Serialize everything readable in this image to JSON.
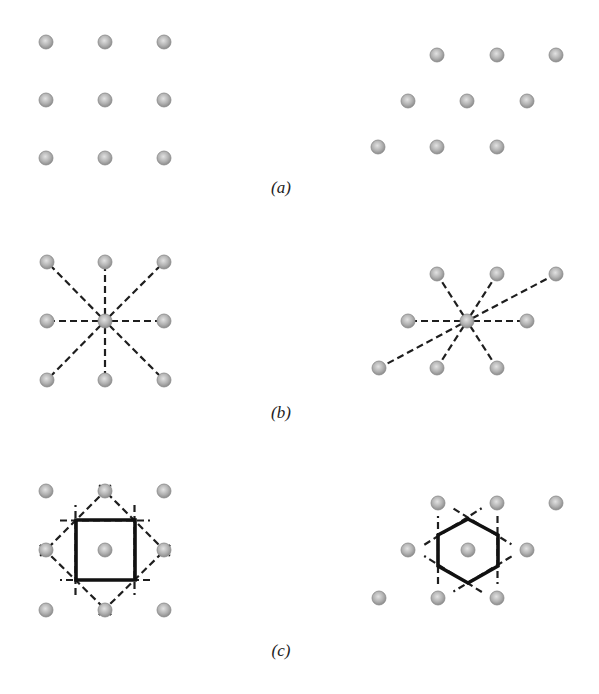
{
  "figure": {
    "panels": [
      {
        "id": "a",
        "label": "(a)",
        "label_pos": [
          281,
          193
        ],
        "description": "Square lattice (left) and hexagonal/oblique lattice (right) of atoms",
        "left_lattice": {
          "type": "square",
          "atoms": [
            [
              46,
              42
            ],
            [
              105,
              42
            ],
            [
              164,
              42
            ],
            [
              46,
              100
            ],
            [
              105,
              100
            ],
            [
              164,
              100
            ],
            [
              46,
              158
            ],
            [
              105,
              158
            ],
            [
              164,
              158
            ]
          ]
        },
        "right_lattice": {
          "type": "hexagonal",
          "atoms": [
            [
              437,
              55
            ],
            [
              497,
              55
            ],
            [
              556,
              55
            ],
            [
              408,
              101
            ],
            [
              467,
              101
            ],
            [
              527,
              101
            ],
            [
              378,
              147
            ],
            [
              437,
              147
            ],
            [
              497,
              147
            ]
          ]
        }
      },
      {
        "id": "b",
        "label": "(b)",
        "label_pos": [
          281,
          418
        ],
        "description": "Dashed lines from central atom to all neighbours",
        "left_lattice": {
          "type": "square",
          "center": [
            105,
            321
          ],
          "atoms": [
            [
              47,
              262
            ],
            [
              105,
              262
            ],
            [
              164,
              262
            ],
            [
              47,
              321
            ],
            [
              105,
              321
            ],
            [
              164,
              321
            ],
            [
              47,
              380
            ],
            [
              105,
              380
            ],
            [
              164,
              380
            ]
          ]
        },
        "right_lattice": {
          "type": "hexagonal",
          "center": [
            467,
            321
          ],
          "atoms": [
            [
              437,
              274
            ],
            [
              497,
              274
            ],
            [
              556,
              274
            ],
            [
              408,
              321
            ],
            [
              467,
              321
            ],
            [
              527,
              321
            ],
            [
              379,
              368
            ],
            [
              437,
              368
            ],
            [
              497,
              368
            ]
          ]
        }
      },
      {
        "id": "c",
        "label": "(c)",
        "label_pos": [
          281,
          656
        ],
        "description": "Wigner-Seitz cell construction: perpendicular bisectors (dashed) and the resulting cell (bold)",
        "left_lattice": {
          "type": "square",
          "center": [
            105,
            550
          ],
          "atoms": [
            [
              46,
              491
            ],
            [
              105,
              491
            ],
            [
              164,
              491
            ],
            [
              46,
              550
            ],
            [
              105,
              550
            ],
            [
              164,
              550
            ],
            [
              46,
              610
            ],
            [
              105,
              610
            ],
            [
              164,
              610
            ]
          ],
          "cell": "square",
          "cell_points": [
            [
              76,
              520
            ],
            [
              135,
              520
            ],
            [
              135,
              580
            ],
            [
              76,
              580
            ]
          ]
        },
        "right_lattice": {
          "type": "hexagonal",
          "center": [
            468,
            550
          ],
          "atoms": [
            [
              438,
              503
            ],
            [
              497,
              503
            ],
            [
              556,
              503
            ],
            [
              408,
              550
            ],
            [
              468,
              550
            ],
            [
              527,
              550
            ],
            [
              379,
              598
            ],
            [
              438,
              598
            ],
            [
              497,
              598
            ]
          ],
          "cell": "hexagon",
          "cell_points": [
            [
              468,
              519
            ],
            [
              498,
              535
            ],
            [
              498,
              566
            ],
            [
              468,
              583
            ],
            [
              438,
              566
            ],
            [
              438,
              535
            ]
          ]
        }
      }
    ],
    "colors": {
      "atom_fill_center": "#d8d8d8",
      "atom_fill_edge": "#8c8c8c",
      "bond_line": "#1e1e1e",
      "cell_line": "#111111",
      "label_text": "#222222",
      "background": "#ffffff"
    }
  }
}
